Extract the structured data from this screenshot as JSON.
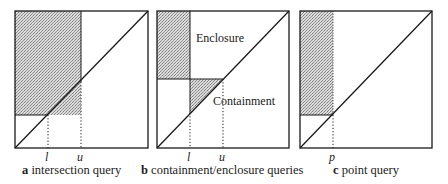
{
  "colors": {
    "stroke": "#1a1a1a",
    "shade_light": "#d8d8d8",
    "shade_dark": "#8c8c8c"
  },
  "panels": [
    {
      "id": "a",
      "letter": "a",
      "caption": "intersection query",
      "ticks": [
        {
          "label": "l",
          "x": 48
        },
        {
          "label": "u",
          "x": 81
        }
      ],
      "box": {
        "x": 15,
        "y": 11,
        "w": 133,
        "h": 137
      }
    },
    {
      "id": "b",
      "letter": "b",
      "caption": "containment/enclosure queries",
      "ticks": [
        {
          "label": "l",
          "x": 190
        },
        {
          "label": "u",
          "x": 223
        }
      ],
      "regions": {
        "enclosure": "Enclosure",
        "containment": "Containment"
      },
      "box": {
        "x": 157,
        "y": 11,
        "w": 132,
        "h": 137
      }
    },
    {
      "id": "c",
      "letter": "c",
      "caption": "point query",
      "ticks": [
        {
          "label": "p",
          "x": 333
        }
      ],
      "box": {
        "x": 300,
        "y": 11,
        "w": 132,
        "h": 137
      }
    }
  ]
}
